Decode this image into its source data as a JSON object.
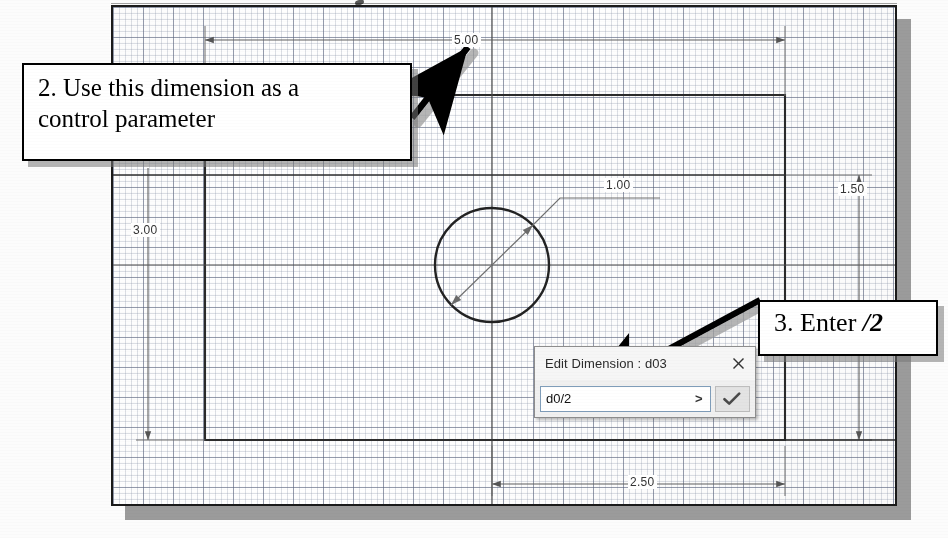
{
  "document": {
    "kind": "cad-sketch-tutorial-figure"
  },
  "callouts": [
    {
      "id": "callout-2",
      "line1": "2. Use this dimension as a",
      "line2": "control parameter"
    },
    {
      "id": "callout-3",
      "prefix": "3. Enter ",
      "emphasis": "/2"
    }
  ],
  "dialog": {
    "title": "Edit Dimension : d03",
    "close_icon": "close-icon",
    "input": {
      "value": "d0/2",
      "placeholder": ""
    },
    "expand_label": ">",
    "accept_icon": "checkmark-icon"
  },
  "dimensions": {
    "top_width": "5.00",
    "circle_diameter": "1.00",
    "right_height": "1.50",
    "left_height": "3.00",
    "bottom_width": "2.50"
  },
  "colors": {
    "ink": "#1a1a1a",
    "grid_major": "#5a647d",
    "grid_minor": "#8c96aa",
    "dimension_gray": "#6a6a6a",
    "arrow_black": "#000000",
    "arrow_gray": "#9b9b9b",
    "dialog_bg": "#f0f0f0",
    "dialog_accept": "#4a4a4a",
    "shadow": "#787878"
  },
  "geometry": {
    "canvas": {
      "x": 111,
      "y": 5,
      "w": 786,
      "h": 501
    },
    "outer_rect": {
      "x": 111,
      "y": 5,
      "w": 786,
      "h": 501
    },
    "inner_rect": {
      "x": 205,
      "y": 95,
      "w": 580,
      "h": 345
    },
    "circle": {
      "cx": 492,
      "cy": 265,
      "r": 57
    }
  }
}
